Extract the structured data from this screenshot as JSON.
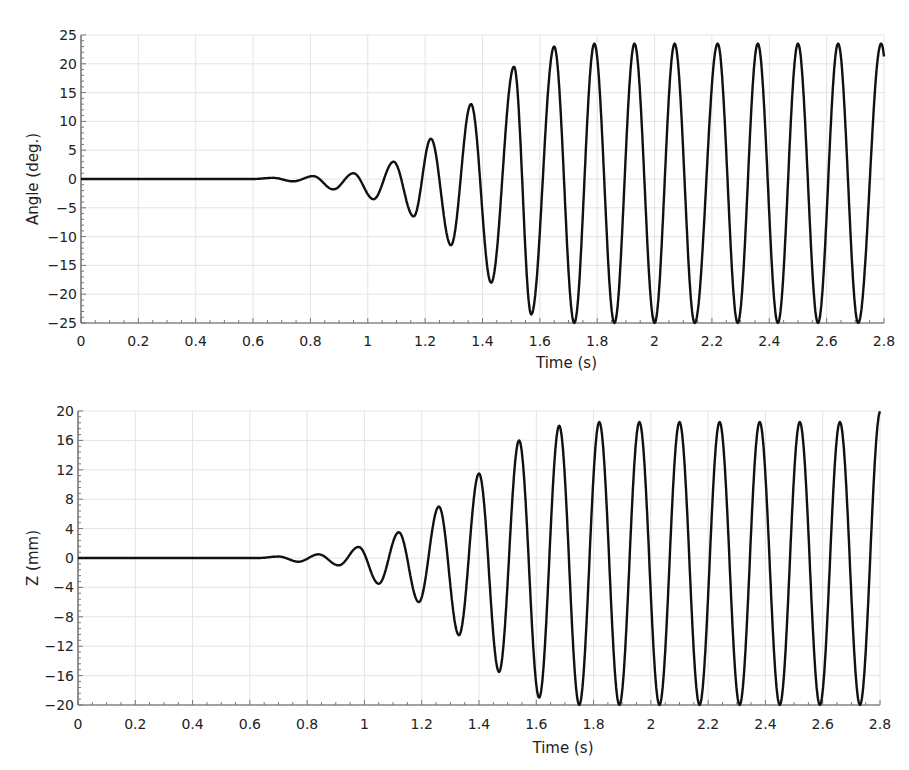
{
  "chart_data": [
    {
      "type": "line",
      "title": "",
      "xlabel": "Time (s)",
      "ylabel": "Angle (deg.)",
      "xlim": [
        0,
        2.8
      ],
      "ylim": [
        -25,
        25
      ],
      "xticks": [
        "0",
        "0.2",
        "0.4",
        "0.6",
        "0.8",
        "1",
        "1.2",
        "1.4",
        "1.6",
        "1.8",
        "2",
        "2.2",
        "2.4",
        "2.6",
        "2.8"
      ],
      "yticks": [
        "25",
        "20",
        "15",
        "10",
        "5",
        "0",
        "-5",
        "-10",
        "-15",
        "-20",
        "-25"
      ],
      "ytick_values": [
        25,
        20,
        15,
        10,
        5,
        0,
        -5,
        -10,
        -15,
        -20,
        -25
      ],
      "grid": true,
      "legend": null,
      "series": [
        {
          "name": "Angle",
          "description": "Growing oscillation (~7 Hz) that saturates near +23.5 / -25 deg after ~1.65 s",
          "peaks": [
            {
              "t": 0.67,
              "v": 0.2
            },
            {
              "t": 0.81,
              "v": 0.5
            },
            {
              "t": 0.95,
              "v": 1.0
            },
            {
              "t": 1.09,
              "v": 3.0
            },
            {
              "t": 1.22,
              "v": 7.0
            },
            {
              "t": 1.36,
              "v": 13.0
            },
            {
              "t": 1.51,
              "v": 19.5
            },
            {
              "t": 1.65,
              "v": 23.0
            },
            {
              "t": 1.79,
              "v": 23.5
            },
            {
              "t": 1.93,
              "v": 23.5
            },
            {
              "t": 2.07,
              "v": 23.5
            },
            {
              "t": 2.22,
              "v": 23.5
            },
            {
              "t": 2.36,
              "v": 23.5
            },
            {
              "t": 2.5,
              "v": 23.5
            },
            {
              "t": 2.64,
              "v": 23.5
            },
            {
              "t": 2.79,
              "v": 23.5
            }
          ],
          "troughs": [
            {
              "t": 0.74,
              "v": -0.4
            },
            {
              "t": 0.88,
              "v": -1.8
            },
            {
              "t": 1.02,
              "v": -3.5
            },
            {
              "t": 1.16,
              "v": -6.5
            },
            {
              "t": 1.29,
              "v": -11.5
            },
            {
              "t": 1.43,
              "v": -18.0
            },
            {
              "t": 1.57,
              "v": -23.5
            },
            {
              "t": 1.72,
              "v": -25.0
            },
            {
              "t": 1.86,
              "v": -25.0
            },
            {
              "t": 2.0,
              "v": -25.0
            },
            {
              "t": 2.14,
              "v": -25.0
            },
            {
              "t": 2.29,
              "v": -25.0
            },
            {
              "t": 2.43,
              "v": -25.0
            },
            {
              "t": 2.57,
              "v": -25.0
            },
            {
              "t": 2.71,
              "v": -25.0
            }
          ],
          "end_value": -2.0
        }
      ]
    },
    {
      "type": "line",
      "title": "",
      "xlabel": "Time (s)",
      "ylabel": "Z (mm)",
      "xlim": [
        0,
        2.8
      ],
      "ylim": [
        -20,
        20
      ],
      "xticks": [
        "0",
        "0.2",
        "0.4",
        "0.6",
        "0.8",
        "1",
        "1.2",
        "1.4",
        "1.6",
        "1.8",
        "2",
        "2.2",
        "2.4",
        "2.6",
        "2.8"
      ],
      "yticks": [
        "20",
        "16",
        "12",
        "8",
        "4",
        "0",
        "-4",
        "-8",
        "-12",
        "-16",
        "-20"
      ],
      "ytick_values": [
        20,
        16,
        12,
        8,
        4,
        0,
        -4,
        -8,
        -12,
        -16,
        -20
      ],
      "grid": true,
      "legend": null,
      "series": [
        {
          "name": "Z",
          "description": "Growing oscillation (~7 Hz) that saturates near +18.5 / -20 mm after ~1.65 s",
          "peaks": [
            {
              "t": 0.7,
              "v": 0.2
            },
            {
              "t": 0.84,
              "v": 0.5
            },
            {
              "t": 0.98,
              "v": 1.5
            },
            {
              "t": 1.12,
              "v": 3.5
            },
            {
              "t": 1.26,
              "v": 7.0
            },
            {
              "t": 1.4,
              "v": 11.5
            },
            {
              "t": 1.54,
              "v": 16.0
            },
            {
              "t": 1.68,
              "v": 18.0
            },
            {
              "t": 1.82,
              "v": 18.5
            },
            {
              "t": 1.96,
              "v": 18.5
            },
            {
              "t": 2.1,
              "v": 18.5
            },
            {
              "t": 2.24,
              "v": 18.5
            },
            {
              "t": 2.38,
              "v": 18.5
            },
            {
              "t": 2.52,
              "v": 18.5
            },
            {
              "t": 2.66,
              "v": 18.5
            },
            {
              "t": 2.8,
              "v": 18.0
            }
          ],
          "troughs": [
            {
              "t": 0.77,
              "v": -0.5
            },
            {
              "t": 0.91,
              "v": -1.0
            },
            {
              "t": 1.05,
              "v": -3.5
            },
            {
              "t": 1.19,
              "v": -6.0
            },
            {
              "t": 1.33,
              "v": -10.5
            },
            {
              "t": 1.47,
              "v": -15.5
            },
            {
              "t": 1.61,
              "v": -19.0
            },
            {
              "t": 1.75,
              "v": -20.0
            },
            {
              "t": 1.89,
              "v": -20.0
            },
            {
              "t": 2.03,
              "v": -20.0
            },
            {
              "t": 2.17,
              "v": -20.0
            },
            {
              "t": 2.31,
              "v": -20.0
            },
            {
              "t": 2.45,
              "v": -20.0
            },
            {
              "t": 2.59,
              "v": -20.0
            },
            {
              "t": 2.73,
              "v": -20.0
            }
          ],
          "end_value": 18.0
        }
      ]
    }
  ],
  "charts": {
    "top": {
      "xlabel": "Time (s)",
      "ylabel": "Angle (deg.)",
      "xticks": [
        "0",
        "0.2",
        "0.4",
        "0.6",
        "0.8",
        "1",
        "1.2",
        "1.4",
        "1.6",
        "1.8",
        "2",
        "2.2",
        "2.4",
        "2.6",
        "2.8"
      ],
      "yticks": [
        "25",
        "20",
        "15",
        "10",
        "5",
        "0",
        "-5",
        "-10",
        "-15",
        "-20",
        "-25"
      ]
    },
    "bottom": {
      "xlabel": "Time (s)",
      "ylabel": "Z (mm)",
      "xticks": [
        "0",
        "0.2",
        "0.4",
        "0.6",
        "0.8",
        "1",
        "1.2",
        "1.4",
        "1.6",
        "1.8",
        "2",
        "2.2",
        "2.4",
        "2.6",
        "2.8"
      ],
      "yticks": [
        "20",
        "16",
        "12",
        "8",
        "4",
        "0",
        "-4",
        "-8",
        "-12",
        "-16",
        "-20"
      ]
    }
  },
  "colors": {
    "curve": "#111111",
    "grid": "#e4e4e4",
    "axis": "#555555",
    "text": "#222222",
    "background": "#ffffff"
  }
}
